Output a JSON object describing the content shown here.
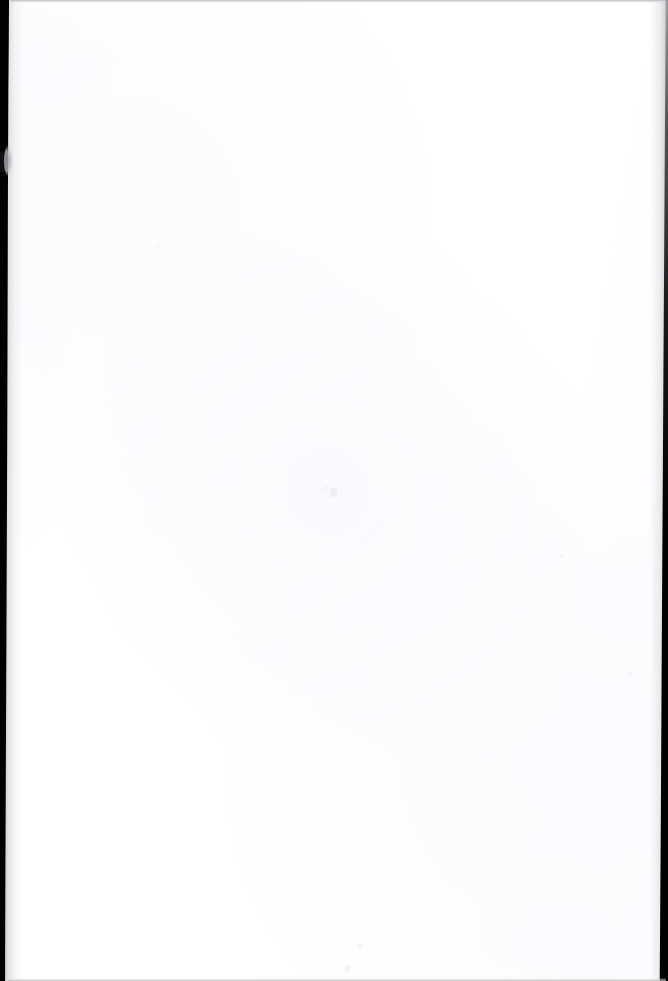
{
  "document": {
    "type": "scanned-page",
    "title": "Scanned blank page",
    "page_label": "",
    "body_text": "",
    "content_note": "This page is blank — no text, figures, tables or captions are present.",
    "orientation": "portrait",
    "width_px": 668,
    "height_px": 981
  },
  "canvas": {
    "paper_color": "#ffffff",
    "paper_tint": "#fdfdfe",
    "background_color": "#ffffff"
  },
  "artifacts": {
    "left_edge": {
      "name": "left-scanner-edge",
      "color": "#000000",
      "width_top_px": 9,
      "width_bottom_px": 5,
      "description": "Solid black scanner bezel strip running the full page height, widest at the top and tapering toward the bottom."
    },
    "left_notch": {
      "name": "left-edge-protrusion",
      "color": "#aaaaaf",
      "top_px": 148,
      "height_px": 27,
      "description": "Small pale bulge interrupting the black left strip."
    },
    "right_edge": {
      "name": "right-scanner-edge",
      "color": "#000000",
      "width_top_px": 2,
      "width_bottom_px": 7,
      "description": "Thin dark strip along the right margin, faint at the top and darker and wider toward the bottom."
    },
    "top_edge": {
      "name": "top-edge-rule",
      "color": "#b0b0b6",
      "height_px": 3,
      "description": "Faint gray line along the very top edge of the scan."
    },
    "bottom_edge": {
      "name": "bottom-edge-rule",
      "color": "#b2b2b8",
      "height_px": 3,
      "description": "Faint gray line along the very bottom edge of the scan."
    },
    "specks": {
      "name": "scan-specks",
      "color": "#ececf0",
      "count": 7,
      "description": "A handful of near-white dust specks scattered on the blank page."
    }
  }
}
